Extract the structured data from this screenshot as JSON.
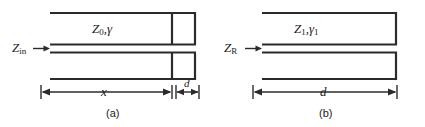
{
  "figure": {
    "background_color": "#ffffff",
    "line_color": "#2b2b2b",
    "text_color": "#1b1b1b"
  },
  "panel_a": {
    "caption": "(a)",
    "line_impedance": {
      "symbol": "Z",
      "subscript": "0",
      "separator": ",",
      "gamma": "γ",
      "full_text": "Z0,γ"
    },
    "port_label": {
      "symbol": "Z",
      "subscript": "in",
      "full_text": "Zin"
    },
    "arrow_icon": "right-arrow-icon",
    "dimension_long": "x",
    "dimension_short": "d"
  },
  "panel_b": {
    "caption": "(b)",
    "line_impedance": {
      "symbol": "Z",
      "subscript": "1",
      "separator": ",",
      "gamma": "γ",
      "gamma_subscript": "1",
      "full_text": "Z1,γ1"
    },
    "port_label": {
      "symbol": "Z",
      "subscript": "R",
      "full_text": "ZR"
    },
    "arrow_icon": "right-arrow-icon",
    "dimension_long": "d"
  }
}
